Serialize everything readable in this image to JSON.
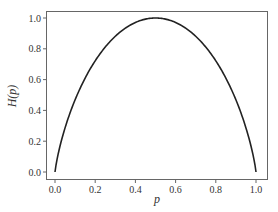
{
  "chart_data": {
    "type": "line",
    "title": "",
    "xlabel": "p",
    "ylabel": "H(p)",
    "xlim": [
      -0.05,
      1.05
    ],
    "ylim": [
      -0.04,
      1.04
    ],
    "xticks": [
      "0.0",
      "0.2",
      "0.4",
      "0.6",
      "0.8",
      "1.0"
    ],
    "yticks": [
      "0.0",
      "0.2",
      "0.4",
      "0.6",
      "0.8",
      "1.0"
    ],
    "grid": false,
    "legend": null,
    "series": [
      {
        "name": "H(p) = -p log2 p - (1-p) log2 (1-p)",
        "x": [
          0.0,
          0.05,
          0.1,
          0.15,
          0.2,
          0.25,
          0.3,
          0.35,
          0.4,
          0.45,
          0.5,
          0.55,
          0.6,
          0.65,
          0.7,
          0.75,
          0.8,
          0.85,
          0.9,
          0.95,
          1.0
        ],
        "y": [
          0.0,
          0.286,
          0.469,
          0.61,
          0.722,
          0.811,
          0.881,
          0.934,
          0.971,
          0.993,
          1.0,
          0.993,
          0.971,
          0.934,
          0.881,
          0.811,
          0.722,
          0.61,
          0.469,
          0.286,
          0.0
        ],
        "color": "#222222"
      }
    ]
  },
  "colors": {
    "line": "#222222",
    "axes": "#555555",
    "text": "#333333"
  }
}
